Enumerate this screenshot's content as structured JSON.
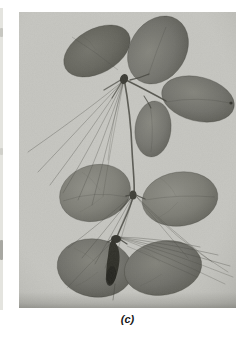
{
  "figure": {
    "caption": "(c)",
    "photo": {
      "kind": "black-and-white botanical photograph",
      "subject": "compound leaf with eight rounded oval leaflets in three clusters joined by thin thread-like stalks, with a dark drooping young leaflet bud at the bottom center"
    }
  },
  "colors": {
    "page_bg": "#ffffff",
    "photo_bg": "#c8c8c3",
    "edge_strip": "#e4e4df",
    "leaf_dark": "#62625a",
    "leaf_mid": "#70706a",
    "leaf_light": "#7b7b73",
    "stem": "#3a3a33",
    "thread": "#45453e",
    "bud": "#2b2b24",
    "caption_color": "#161616"
  }
}
